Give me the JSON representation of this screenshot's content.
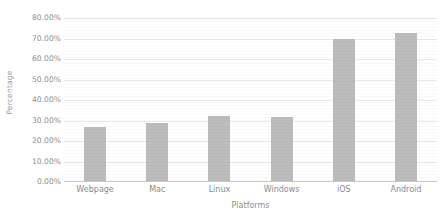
{
  "chart_data": {
    "type": "bar",
    "title": "",
    "xlabel": "Platforms",
    "ylabel": "Percentage",
    "categories": [
      "Webpage",
      "Mac",
      "Linux",
      "Windows",
      "iOS",
      "Android"
    ],
    "values": [
      27.0,
      29.0,
      32.0,
      31.5,
      70.0,
      72.5
    ],
    "ylim": [
      0,
      80
    ],
    "ytick_step": 10,
    "ytick_labels": [
      "0.00%",
      "10.00%",
      "20.00%",
      "30.00%",
      "40.00%",
      "50.00%",
      "60.00%",
      "70.00%",
      "80.00%"
    ],
    "ytick_values": [
      0,
      10,
      20,
      30,
      40,
      50,
      60,
      70,
      80
    ],
    "grid": true,
    "grid_axis": "y",
    "legend": false,
    "legend_position": "none",
    "bar_color": "#bcbcbc",
    "gridline_color": "#eaeaea",
    "axis_color": "#c9c9c9",
    "text_color": "#8a8a8a",
    "background": "#ffffff"
  }
}
